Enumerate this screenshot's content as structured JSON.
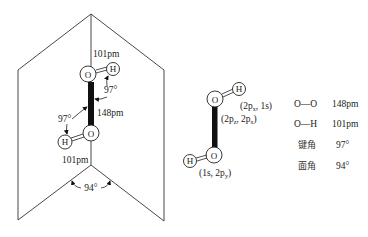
{
  "structure_diagram": {
    "atoms": {
      "oxygen": "O",
      "hydrogen": "H"
    },
    "top_oh_length": "101pm",
    "oo_length": "148pm",
    "top_bond_angle": "97°",
    "bottom_bond_angle": "97°",
    "bottom_oh_length": "101pm",
    "dihedral_angle": "94°"
  },
  "orbital_diagram": {
    "atoms": {
      "oxygen": "O",
      "hydrogen": "H"
    },
    "top_oh_orbitals": {
      "open": "(2p",
      "sub1": "x",
      "mid": ", 1s)"
    },
    "oo_orbitals": {
      "open": "(2p",
      "sub1": "z",
      "mid": ", 2p",
      "sub2": "x",
      "close": ")"
    },
    "bottom_oh_orbitals": {
      "open": "(1s, 2p",
      "sub1": "y",
      "close": ")"
    }
  },
  "parameters_table": {
    "rows": [
      {
        "label": "O—O",
        "value": "148pm"
      },
      {
        "label": "O—H",
        "value": "101pm"
      },
      {
        "label": "键角",
        "value": "97°"
      },
      {
        "label": "面角",
        "value": "94°"
      }
    ]
  }
}
